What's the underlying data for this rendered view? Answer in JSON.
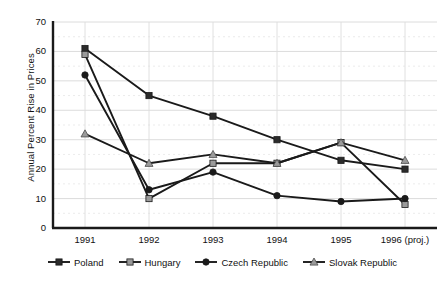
{
  "chart_data": {
    "type": "line",
    "title": "",
    "xlabel": "",
    "ylabel": "Annual Percent Rise in Prices",
    "categories": [
      "1991",
      "1992",
      "1993",
      "1994",
      "1995",
      "1996 (proj.)"
    ],
    "ylim": [
      0,
      70
    ],
    "yticks": [
      0,
      10,
      20,
      30,
      40,
      50,
      60,
      70
    ],
    "grid": {
      "horizontal_major": true,
      "horizontal_minor_dashed": true,
      "vertical": true
    },
    "legend_position": "bottom",
    "series": [
      {
        "name": "Poland",
        "marker": "square",
        "marker_fill": "#2b2b2b",
        "line_color": "#1a1a1a",
        "values": [
          61,
          45,
          38,
          30,
          23,
          20
        ]
      },
      {
        "name": "Hungary",
        "marker": "square",
        "marker_fill": "#9a9a9a",
        "line_color": "#1a1a1a",
        "values": [
          59,
          10,
          22,
          22,
          29,
          8
        ]
      },
      {
        "name": "Czech Republic",
        "marker": "circle",
        "marker_fill": "#1a1a1a",
        "line_color": "#1a1a1a",
        "values": [
          52,
          13,
          19,
          11,
          9,
          10
        ]
      },
      {
        "name": "Slovak Republic",
        "marker": "triangle",
        "marker_fill": "#9a9a9a",
        "line_color": "#1a1a1a",
        "values": [
          32,
          22,
          25,
          22,
          29,
          23
        ]
      }
    ]
  },
  "ytick_labels": [
    "70",
    "60",
    "50",
    "40",
    "30",
    "20",
    "10",
    "0"
  ],
  "xtick_labels": [
    "1991",
    "1992",
    "1993",
    "1994",
    "1995",
    "1996 (proj.)"
  ],
  "axis": {
    "y_title": "Annual Percent Rise in Prices"
  },
  "legend": {
    "items": [
      {
        "label": "Poland"
      },
      {
        "label": "Hungary"
      },
      {
        "label": "Czech Republic"
      },
      {
        "label": "Slovak Republic"
      }
    ]
  },
  "colors": {
    "axis_line": "#1a1a1a",
    "grid_major": "#d8d8d8",
    "grid_minor": "#e6e6e6",
    "grid_vertical": "#dcdcdc",
    "series_dark": "#1a1a1a",
    "series_light": "#9a9a9a",
    "background": "#ffffff",
    "text": "#111111"
  }
}
